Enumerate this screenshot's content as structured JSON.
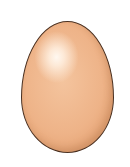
{
  "image": {
    "subject": "egg",
    "description": "Brown chicken egg illustration on white background",
    "colors": {
      "background": "#ffffff",
      "shell_base": "#eeb388",
      "shell_highlight": "#fff8f0",
      "outline": "#4a3020"
    }
  }
}
